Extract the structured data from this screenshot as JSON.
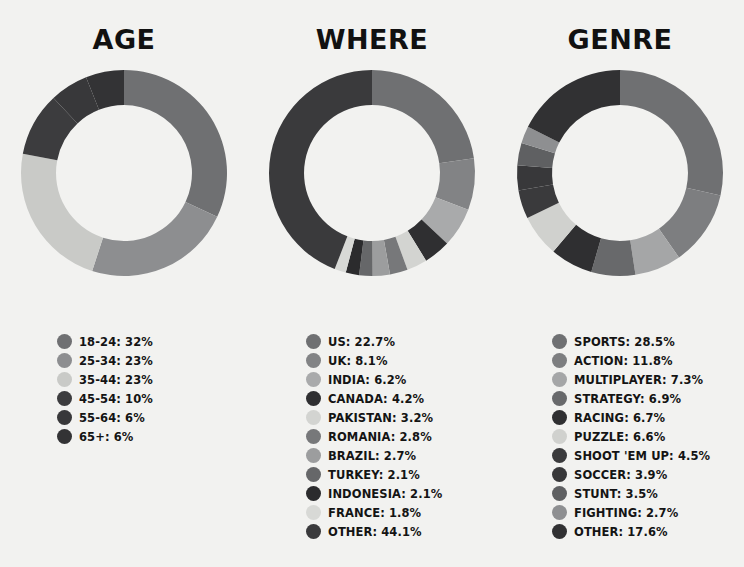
{
  "background_color": "#f2f2f0",
  "text_color": "#141414",
  "panels": [
    {
      "id": "age",
      "title": "AGE",
      "chart_name": "age-donut-chart",
      "legend_name": "age-legend"
    },
    {
      "id": "where",
      "title": "WHERE",
      "chart_name": "where-donut-chart",
      "legend_name": "where-legend"
    },
    {
      "id": "genre",
      "title": "GENRE",
      "chart_name": "genre-donut-chart",
      "legend_name": "genre-legend"
    }
  ],
  "chart_data": [
    {
      "type": "pie",
      "variant": "donut",
      "title": "AGE",
      "start_angle_deg": 0,
      "direction": "clockwise",
      "inner_radius_ratio": 0.66,
      "categories": [
        "18-24",
        "25-34",
        "35-44",
        "45-54",
        "55-64",
        "65+"
      ],
      "values": [
        32,
        23,
        23,
        10,
        6,
        6
      ],
      "value_unit": "%",
      "colors": [
        "#6f7072",
        "#8d8e90",
        "#c9cac7",
        "#3c3c3e",
        "#38383a",
        "#333335"
      ],
      "legend": [
        {
          "label": "18-24: 32%",
          "name": "18-24",
          "value": 32,
          "color": "#6f7072"
        },
        {
          "label": "25-34: 23%",
          "name": "25-34",
          "value": 23,
          "color": "#8d8e90"
        },
        {
          "label": "35-44: 23%",
          "name": "35-44",
          "value": 23,
          "color": "#c9cac7"
        },
        {
          "label": "45-54: 10%",
          "name": "45-54",
          "value": 10,
          "color": "#3c3c3e"
        },
        {
          "label": "55-64: 6%",
          "name": "55-64",
          "value": 6,
          "color": "#38383a"
        },
        {
          "label": "65+: 6%",
          "name": "65+",
          "value": 6,
          "color": "#333335"
        }
      ],
      "legend_position": "below"
    },
    {
      "type": "pie",
      "variant": "donut",
      "title": "WHERE",
      "start_angle_deg": 0,
      "direction": "clockwise",
      "inner_radius_ratio": 0.66,
      "categories": [
        "US",
        "UK",
        "INDIA",
        "CANADA",
        "PAKISTAN",
        "ROMANIA",
        "BRAZIL",
        "TURKEY",
        "INDONESIA",
        "FRANCE",
        "OTHER"
      ],
      "values": [
        22.7,
        8.1,
        6.2,
        4.2,
        3.2,
        2.8,
        2.7,
        2.1,
        2.1,
        1.8,
        44.1
      ],
      "value_unit": "%",
      "colors": [
        "#6f7072",
        "#828385",
        "#a9aaab",
        "#2f2f31",
        "#d3d4d1",
        "#77787a",
        "#9c9d9e",
        "#666769",
        "#2b2b2d",
        "#d8d9d6",
        "#3a3a3c"
      ],
      "legend": [
        {
          "label": "US: 22.7%",
          "name": "US",
          "value": 22.7,
          "color": "#6f7072"
        },
        {
          "label": "UK: 8.1%",
          "name": "UK",
          "value": 8.1,
          "color": "#828385"
        },
        {
          "label": "INDIA: 6.2%",
          "name": "INDIA",
          "value": 6.2,
          "color": "#a9aaab"
        },
        {
          "label": "CANADA: 4.2%",
          "name": "CANADA",
          "value": 4.2,
          "color": "#2f2f31"
        },
        {
          "label": "PAKISTAN: 3.2%",
          "name": "PAKISTAN",
          "value": 3.2,
          "color": "#d3d4d1"
        },
        {
          "label": "ROMANIA: 2.8%",
          "name": "ROMANIA",
          "value": 2.8,
          "color": "#77787a"
        },
        {
          "label": "BRAZIL: 2.7%",
          "name": "BRAZIL",
          "value": 2.7,
          "color": "#9c9d9e"
        },
        {
          "label": "TURKEY: 2.1%",
          "name": "TURKEY",
          "value": 2.1,
          "color": "#666769"
        },
        {
          "label": "INDONESIA: 2.1%",
          "name": "INDONESIA",
          "value": 2.1,
          "color": "#2b2b2d"
        },
        {
          "label": "FRANCE: 1.8%",
          "name": "FRANCE",
          "value": 1.8,
          "color": "#d8d9d6"
        },
        {
          "label": "OTHER: 44.1%",
          "name": "OTHER",
          "value": 44.1,
          "color": "#3a3a3c"
        }
      ],
      "legend_position": "below"
    },
    {
      "type": "pie",
      "variant": "donut",
      "title": "GENRE",
      "start_angle_deg": 0,
      "direction": "clockwise",
      "inner_radius_ratio": 0.66,
      "categories": [
        "SPORTS",
        "ACTION",
        "MULTIPLAYER",
        "STRATEGY",
        "RACING",
        "PUZZLE",
        "SHOOT 'EM UP",
        "SOCCER",
        "STUNT",
        "FIGHTING",
        "OTHER"
      ],
      "values": [
        28.5,
        11.8,
        7.3,
        6.9,
        6.7,
        6.6,
        4.5,
        3.9,
        3.5,
        2.7,
        17.6
      ],
      "value_unit": "%",
      "colors": [
        "#6f7072",
        "#7d7e80",
        "#a5a6a7",
        "#68696b",
        "#2f2f31",
        "#d0d1ce",
        "#3a3a3c",
        "#38383a",
        "#5f6062",
        "#8e8f91",
        "#313133"
      ],
      "legend": [
        {
          "label": "SPORTS: 28.5%",
          "name": "SPORTS",
          "value": 28.5,
          "color": "#6f7072"
        },
        {
          "label": "ACTION: 11.8%",
          "name": "ACTION",
          "value": 11.8,
          "color": "#7d7e80"
        },
        {
          "label": "MULTIPLAYER: 7.3%",
          "name": "MULTIPLAYER",
          "value": 7.3,
          "color": "#a5a6a7"
        },
        {
          "label": "STRATEGY: 6.9%",
          "name": "STRATEGY",
          "value": 6.9,
          "color": "#68696b"
        },
        {
          "label": "RACING: 6.7%",
          "name": "RACING",
          "value": 6.7,
          "color": "#2f2f31"
        },
        {
          "label": "PUZZLE: 6.6%",
          "name": "PUZZLE",
          "value": 6.6,
          "color": "#d0d1ce"
        },
        {
          "label": "SHOOT 'EM UP: 4.5%",
          "name": "SHOOT 'EM UP",
          "value": 4.5,
          "color": "#3a3a3c"
        },
        {
          "label": "SOCCER: 3.9%",
          "name": "SOCCER",
          "value": 3.9,
          "color": "#38383a"
        },
        {
          "label": "STUNT: 3.5%",
          "name": "STUNT",
          "value": 3.5,
          "color": "#5f6062"
        },
        {
          "label": "FIGHTING: 2.7%",
          "name": "FIGHTING",
          "value": 2.7,
          "color": "#8e8f91"
        },
        {
          "label": "OTHER: 17.6%",
          "name": "OTHER",
          "value": 17.6,
          "color": "#313133"
        }
      ],
      "legend_position": "below"
    }
  ]
}
